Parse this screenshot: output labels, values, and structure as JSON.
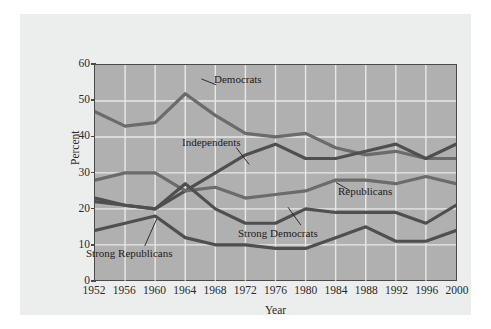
{
  "chart_data": {
    "type": "line",
    "title": "",
    "xlabel": "Year",
    "ylabel": "Percent",
    "categories": [
      1952,
      1956,
      1960,
      1964,
      1968,
      1972,
      1976,
      1980,
      1984,
      1988,
      1992,
      1996,
      2000
    ],
    "xlim": [
      1952,
      2000
    ],
    "ylim": [
      0,
      60
    ],
    "yticks": [
      0,
      10,
      20,
      30,
      40,
      50,
      60
    ],
    "xticks": [
      "1952",
      "1956",
      "1960",
      "1964",
      "1968",
      "1972",
      "1976",
      "1980",
      "1984",
      "1988",
      "1992",
      "1996",
      "2000"
    ],
    "grid": true,
    "legend": "inline-annotations",
    "series": [
      {
        "name": "Democrats",
        "values": [
          47,
          43,
          44,
          52,
          46,
          41,
          40,
          41,
          37,
          35,
          36,
          34,
          34
        ]
      },
      {
        "name": "Independents",
        "values": [
          23,
          21,
          20,
          25,
          30,
          35,
          38,
          34,
          34,
          36,
          38,
          34,
          38
        ]
      },
      {
        "name": "Republicans",
        "values": [
          28,
          30,
          30,
          25,
          26,
          23,
          24,
          25,
          28,
          28,
          27,
          29,
          27
        ]
      },
      {
        "name": "Strong Democrats",
        "values": [
          22,
          21,
          20,
          27,
          20,
          16,
          16,
          20,
          19,
          19,
          19,
          16,
          21
        ]
      },
      {
        "name": "Strong Republicans",
        "values": [
          14,
          16,
          18,
          12,
          10,
          10,
          9,
          9,
          12,
          15,
          11,
          11,
          14
        ]
      }
    ]
  },
  "annotations": [
    {
      "id": "democrats-label",
      "text": "Democrats"
    },
    {
      "id": "independents-label",
      "text": "Independents"
    },
    {
      "id": "republicans-label",
      "text": "Republicans"
    },
    {
      "id": "strong-democrats-label",
      "text": "Strong Democrats"
    },
    {
      "id": "strong-republicans-label",
      "text": "Strong Republicans"
    }
  ],
  "axes": {
    "y_title": "Percent",
    "x_title": "Year",
    "y_tick_labels": [
      "60",
      "50",
      "40",
      "30",
      "20",
      "10",
      "0"
    ],
    "x_tick_labels": [
      "1952",
      "1956",
      "1960",
      "1964",
      "1968",
      "1972",
      "1976",
      "1980",
      "1984",
      "1988",
      "1992",
      "1996",
      "2000"
    ]
  },
  "colors": {
    "page_background": "#ffffff",
    "panel_background": "#eceded",
    "plot_background": "#b0b0b0",
    "gridline": "#e8e8e8",
    "axis_line": "#4a4a4a",
    "series_line": "#6b6b6b",
    "series_line_dark": "#4f4f4f",
    "text": "#2b2b2b"
  }
}
